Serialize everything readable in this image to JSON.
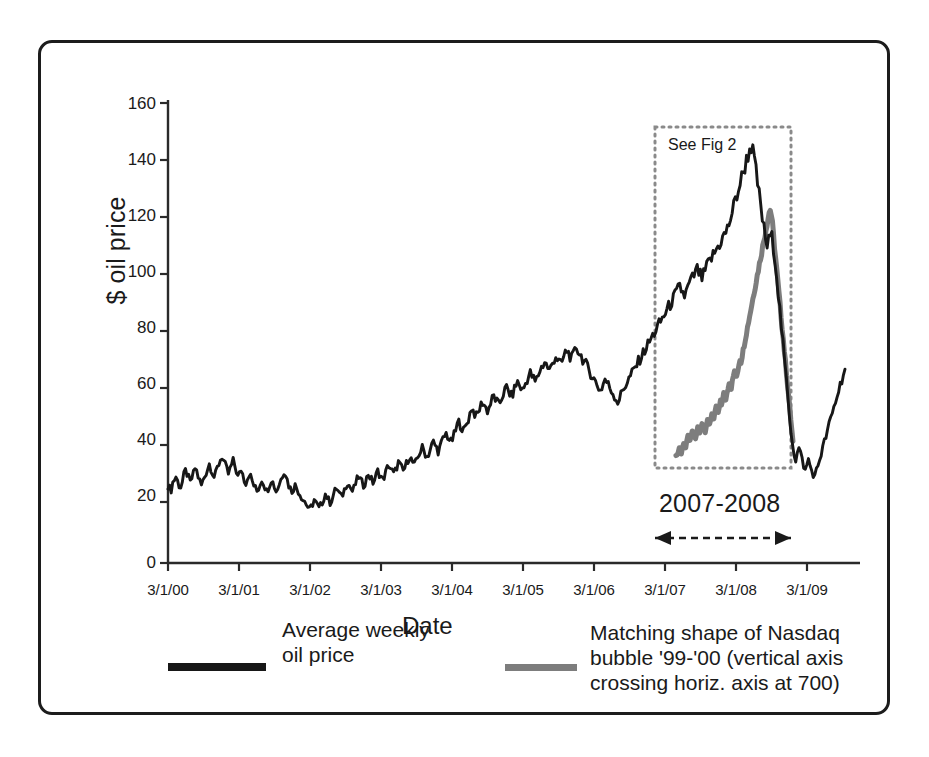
{
  "figure": {
    "frame_border_color": "#1c1c1c",
    "background": "#ffffff"
  },
  "annotations": {
    "see_fig": "See Fig 2",
    "range_label": "2007-2008"
  },
  "legend": {
    "entries": [
      {
        "label": "Average weekly oil price",
        "color": "#171717",
        "name": "oil-price"
      },
      {
        "label": "Matching shape of Nasdaq bubble '99-'00 (vertical axis crossing horiz. axis at 700)",
        "color": "#7d7d7d",
        "name": "nasdaq-bubble"
      }
    ]
  },
  "chart_data": {
    "type": "line",
    "title": "",
    "xlabel": "Date",
    "ylabel": "$ oil price",
    "ylim": [
      0,
      160
    ],
    "yticks": [
      0,
      20,
      40,
      60,
      80,
      100,
      120,
      140,
      160
    ],
    "xticks": [
      "3/1/00",
      "3/1/01",
      "3/1/02",
      "3/1/03",
      "3/1/04",
      "3/1/05",
      "3/1/06",
      "3/1/07",
      "3/1/08",
      "3/1/09"
    ],
    "xlim": [
      "3/1/00",
      "7/1/09"
    ],
    "grid": false,
    "legend_position": "below-axes",
    "annotations": [
      {
        "text": "See Fig 2",
        "type": "dotted-box",
        "x_range": [
          "1/1/07",
          "12/1/08"
        ],
        "y_range": [
          5,
          150
        ]
      },
      {
        "text": "2007-2008",
        "type": "double-arrow",
        "x_range": [
          "1/1/07",
          "12/1/08"
        ]
      }
    ],
    "series": [
      {
        "name": "Average weekly oil price",
        "color": "#171717",
        "values": [
          27,
          26,
          25.5,
          28,
          29,
          30,
          28.5,
          27,
          26.5,
          28,
          30.5,
          32,
          31,
          29.5,
          28,
          29.5,
          31,
          33,
          32,
          30,
          28.5,
          27,
          28.5,
          30,
          31.5,
          33,
          34.5,
          33,
          31.5,
          30,
          31,
          33,
          34.5,
          36,
          37,
          35.5,
          34,
          32.5,
          31,
          32.5,
          34,
          35.5,
          34,
          32,
          30,
          31,
          32.5,
          31,
          29,
          28,
          29.5,
          31,
          30,
          28.5,
          27,
          26,
          25,
          26,
          27.5,
          29,
          28,
          26.5,
          25,
          26,
          27.5,
          29,
          28,
          26.5,
          25,
          26,
          27.5,
          29,
          30.5,
          32,
          31,
          29,
          27,
          26,
          25,
          26,
          27,
          26,
          25,
          24,
          23,
          22,
          21.5,
          20.5,
          19.5,
          18.5,
          19.5,
          20.5,
          22,
          21,
          20,
          19,
          20,
          21,
          22.5,
          24,
          23,
          22,
          21,
          22,
          23.5,
          25,
          26,
          25,
          24,
          23,
          24,
          25.5,
          27,
          28,
          27,
          26,
          25,
          26,
          27.5,
          29,
          30,
          29,
          28,
          27,
          28,
          29.5,
          31,
          30,
          29,
          28,
          29,
          30.5,
          32,
          31,
          30,
          29,
          30,
          31.5,
          33,
          34,
          33,
          32,
          31,
          32,
          33.5,
          35,
          34,
          33,
          32,
          33,
          34.5,
          36,
          37,
          36,
          35,
          34,
          35,
          36.5,
          38,
          39,
          40,
          39,
          38,
          37,
          38,
          39.5,
          41,
          42,
          41,
          40,
          39,
          40,
          41.5,
          43,
          44,
          45,
          44,
          43,
          42,
          43,
          44.5,
          46,
          48,
          49,
          48,
          47,
          46,
          47,
          48.5,
          50,
          52,
          54,
          53,
          52,
          51,
          52,
          53.5,
          55,
          56,
          55,
          54,
          53,
          54,
          55.5,
          57,
          58,
          57,
          56,
          55,
          56,
          57.5,
          59,
          60,
          61,
          60,
          59,
          58,
          59,
          60.5,
          62,
          63,
          62,
          61,
          60,
          61,
          62.5,
          64,
          65,
          66,
          65,
          64,
          63,
          64,
          65.5,
          67,
          68,
          69,
          70,
          69,
          68,
          67,
          68,
          69.5,
          71,
          72,
          71,
          70,
          69,
          70,
          71.5,
          73,
          74,
          73,
          72,
          71,
          72,
          73.5,
          75,
          74,
          73,
          72,
          71,
          70,
          69,
          68,
          67,
          66,
          65,
          64,
          63,
          62,
          61,
          60,
          61,
          62.5,
          64,
          63,
          62,
          61,
          60,
          59,
          58,
          57,
          56,
          57,
          58.5,
          60,
          61,
          62,
          63,
          64,
          65,
          66,
          67,
          68,
          69,
          70,
          71,
          72,
          73,
          74,
          75,
          76,
          77,
          78,
          79,
          80,
          81,
          82,
          83,
          84,
          85,
          86,
          87,
          88,
          89,
          90,
          91,
          92,
          93,
          94,
          95,
          96,
          95,
          94,
          93,
          94,
          95.5,
          97,
          98,
          99,
          100,
          101,
          102,
          101,
          100,
          99,
          100,
          101.5,
          103,
          104,
          105,
          106,
          107,
          108,
          109,
          110,
          111,
          112,
          113,
          114,
          115,
          116,
          118,
          120,
          122,
          124,
          126,
          128,
          130,
          132,
          134,
          136,
          138,
          140,
          142,
          144,
          145,
          143,
          140,
          136,
          132,
          128,
          124,
          120,
          116,
          113,
          110,
          112,
          114,
          113,
          110,
          106,
          100,
          94,
          88,
          82,
          76,
          70,
          64,
          58,
          52,
          46,
          42,
          38,
          36,
          38,
          40,
          38,
          36,
          34,
          32,
          34,
          36,
          34,
          32,
          31,
          30,
          32,
          34,
          36,
          38,
          40,
          42,
          44,
          46,
          48,
          50,
          52,
          54,
          56,
          58,
          60,
          62,
          64,
          66,
          67
        ]
      },
      {
        "name": "Matching shape of Nasdaq bubble '99-'00",
        "color": "#7d7d7d",
        "note": "vertical axis crossing horiz. axis at 700",
        "values": [
          38,
          37,
          39,
          40,
          39,
          38,
          40,
          42,
          41,
          40,
          42,
          44,
          43,
          42,
          44,
          46,
          45,
          44,
          43,
          45,
          47,
          46,
          45,
          47,
          49,
          48,
          47,
          46,
          48,
          50,
          49,
          48,
          50,
          52,
          51,
          50,
          52,
          54,
          53,
          52,
          54,
          56,
          55,
          57,
          59,
          58,
          57,
          59,
          61,
          63,
          62,
          61,
          63,
          65,
          67,
          66,
          65,
          67,
          69,
          71,
          70,
          72,
          74,
          76,
          78,
          80,
          82,
          84,
          86,
          88,
          90,
          92,
          94,
          96,
          98,
          100,
          102,
          104,
          106,
          108,
          110,
          112,
          114,
          116,
          118,
          120,
          122,
          123,
          121,
          118,
          114,
          110,
          106,
          102,
          98,
          94,
          90,
          86,
          82,
          78,
          74,
          70,
          66,
          62,
          58,
          54,
          50,
          46,
          42
        ]
      }
    ]
  }
}
